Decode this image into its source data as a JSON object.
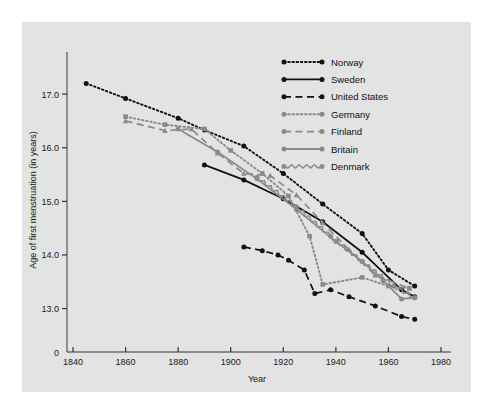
{
  "figure": {
    "background_color": "#e3e3e3",
    "page_background": "#ffffff"
  },
  "chart_data": {
    "type": "line",
    "title": "",
    "subtitle": "",
    "xlabel": "Year",
    "ylabel": "Age of first menstruation (in years)",
    "xlim": [
      1840,
      1980
    ],
    "ylim": [
      12.6,
      17.45
    ],
    "xticks": [
      1840,
      1860,
      1880,
      1900,
      1920,
      1940,
      1960,
      1980
    ],
    "xtick_labels": [
      "1840",
      "1860",
      "1880",
      "1900",
      "1920",
      "1940",
      "1960",
      "1980"
    ],
    "yticks": [
      13.0,
      14.0,
      15.0,
      16.0,
      17.0
    ],
    "ytick_labels": [
      "13.0",
      "14.0",
      "15.0",
      "16.0",
      "17.0"
    ],
    "origin_label": "0",
    "grid": false,
    "legend_position": "top-right",
    "series": [
      {
        "name": "Norway",
        "color": "#111111",
        "style": "dotted",
        "marker": "circle",
        "x": [
          1845,
          1860,
          1880,
          1890,
          1905,
          1920,
          1935,
          1950,
          1960,
          1970
        ],
        "y": [
          17.2,
          16.92,
          16.55,
          16.33,
          16.03,
          15.52,
          14.95,
          14.4,
          13.72,
          13.42
        ]
      },
      {
        "name": "Sweden",
        "color": "#111111",
        "style": "solid",
        "marker": "circle",
        "x": [
          1890,
          1905,
          1920,
          1935,
          1950,
          1965,
          1970
        ],
        "y": [
          15.68,
          15.4,
          15.05,
          14.62,
          14.05,
          13.35,
          13.22
        ]
      },
      {
        "name": "United States",
        "color": "#111111",
        "style": "dashed",
        "marker": "circle",
        "x": [
          1905,
          1912,
          1918,
          1922,
          1928,
          1932,
          1938,
          1945,
          1955,
          1965,
          1970
        ],
        "y": [
          14.15,
          14.08,
          14.0,
          13.9,
          13.72,
          13.28,
          13.35,
          13.22,
          13.05,
          12.85,
          12.8
        ]
      },
      {
        "name": "Germany",
        "color": "#8a8a8a",
        "style": "dotted",
        "marker": "square",
        "x": [
          1860,
          1875,
          1890,
          1900,
          1912,
          1922,
          1930,
          1935,
          1950,
          1960,
          1968
        ],
        "y": [
          16.58,
          16.43,
          16.35,
          15.95,
          15.52,
          15.1,
          14.35,
          13.45,
          13.58,
          13.42,
          13.38
        ]
      },
      {
        "name": "Finland",
        "color": "#8a8a8a",
        "style": "dashed",
        "marker": "triangle",
        "x": [
          1860,
          1875,
          1885,
          1895,
          1905,
          1915,
          1925,
          1935,
          1945,
          1955,
          1968
        ],
        "y": [
          16.5,
          16.32,
          16.35,
          15.9,
          15.52,
          15.48,
          15.12,
          14.6,
          14.1,
          13.62,
          13.38
        ]
      },
      {
        "name": "Britain",
        "color": "#8a8a8a",
        "style": "solid",
        "marker": "circle",
        "x": [
          1880,
          1895,
          1910,
          1925,
          1940,
          1950,
          1958,
          1965,
          1970
        ],
        "y": [
          16.35,
          15.92,
          15.42,
          14.85,
          14.25,
          13.88,
          13.52,
          13.18,
          13.2
        ]
      },
      {
        "name": "Denmark",
        "color": "#8a8a8a",
        "style": "zigzag",
        "marker": "circle",
        "x": [
          1910,
          1925,
          1938,
          1950,
          1962,
          1970
        ],
        "y": [
          15.45,
          14.9,
          14.35,
          13.88,
          13.42,
          13.2
        ]
      }
    ]
  },
  "legend": {
    "entries": [
      {
        "label": "Norway",
        "color": "#111111",
        "style": "dotted"
      },
      {
        "label": "Sweden",
        "color": "#111111",
        "style": "solid"
      },
      {
        "label": "United States",
        "color": "#111111",
        "style": "dashed"
      },
      {
        "label": "Germany",
        "color": "#8a8a8a",
        "style": "dotted"
      },
      {
        "label": "Finland",
        "color": "#8a8a8a",
        "style": "dashed"
      },
      {
        "label": "Britain",
        "color": "#8a8a8a",
        "style": "solid"
      },
      {
        "label": "Denmark",
        "color": "#8a8a8a",
        "style": "zigzag"
      }
    ]
  }
}
